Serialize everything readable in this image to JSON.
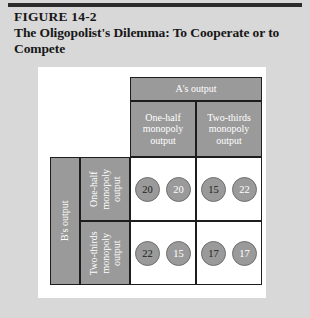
{
  "figure": {
    "number": "FIGURE 14-2",
    "title": "The Oligopolist's Dilemma: To Cooperate or to Compete"
  },
  "matrix": {
    "column_axis_label": "A's output",
    "row_axis_label": "B's output",
    "column_categories": [
      "One-half monopoly output",
      "Two-thirds monopoly output"
    ],
    "row_categories": [
      "One-half monopoly output",
      "Two-thirds monopoly output"
    ],
    "cells": [
      {
        "row": 0,
        "col": 0,
        "b_payoff": "20",
        "a_payoff": "20"
      },
      {
        "row": 0,
        "col": 1,
        "b_payoff": "15",
        "a_payoff": "22"
      },
      {
        "row": 1,
        "col": 0,
        "b_payoff": "22",
        "a_payoff": "15"
      },
      {
        "row": 1,
        "col": 1,
        "b_payoff": "17",
        "a_payoff": "17"
      }
    ]
  },
  "colors": {
    "page_background": "#d8d8d8",
    "panel_background": "#ffffff",
    "header_fill": "#9a9a9a",
    "header_text": "#ffffff",
    "circle_fill": "#9a9a9a",
    "rule": "#2b2b2b",
    "border": "#1d1d1d"
  }
}
